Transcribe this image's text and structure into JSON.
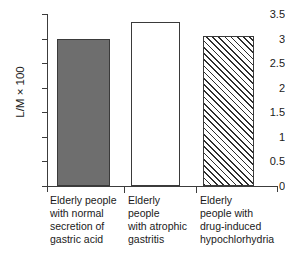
{
  "chart_data": {
    "type": "bar",
    "title": "",
    "xlabel": "",
    "ylabel": "L/M × 100",
    "ylim": [
      0,
      3.5
    ],
    "grid": false,
    "legend": "none",
    "categories": [
      "Elderly people with normal secretion of gastric acid",
      "Elderly people with atrophic gastritis",
      "Elderly people with drug-induced hypochlorhydria"
    ],
    "values": [
      2.99,
      3.34,
      3.05
    ],
    "y_ticks": [
      "0",
      "0.5",
      "1",
      "1.5",
      "2",
      "2.5",
      "3",
      "3.5"
    ],
    "y_tick_values": [
      0,
      0.5,
      1,
      1.5,
      2,
      2.5,
      3,
      3.5
    ],
    "bar_styles": [
      "solid-gray",
      "open-white",
      "diagonal-hatch"
    ],
    "colors": {
      "bar_solid_fill": "#6e6e6e",
      "bar_open_fill": "#ffffff",
      "bar_hatch_line": "#2e2e2e",
      "bar_edge": "#3a3a3a",
      "axis": "#3c3c3c",
      "text": "#1a1a1a",
      "background": "#ffffff"
    }
  },
  "axis": {
    "y_title": "L/M × 100",
    "ticks": [
      {
        "label": "3.5",
        "value": 3.5
      },
      {
        "label": "3",
        "value": 3
      },
      {
        "label": "2.5",
        "value": 2.5
      },
      {
        "label": "2",
        "value": 2
      },
      {
        "label": "1.5",
        "value": 1.5
      },
      {
        "label": "1",
        "value": 1
      },
      {
        "label": "0.5",
        "value": 0.5
      },
      {
        "label": "0",
        "value": 0
      }
    ]
  },
  "categories": [
    {
      "lines": [
        "Elderly people",
        "with normal",
        "secretion of",
        "gastric acid"
      ]
    },
    {
      "lines": [
        "Elderly",
        "people",
        "with atrophic",
        "gastritis"
      ]
    },
    {
      "lines": [
        "Elderly",
        "people with",
        "drug-induced",
        "hypochlorhydria"
      ]
    }
  ]
}
